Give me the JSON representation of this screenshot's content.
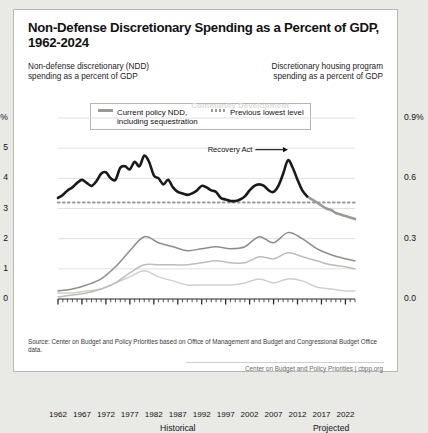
{
  "title": "Non-Defense Discretionary Spending as a Percent of GDP, 1962-2024",
  "subtitle_left": "Non-defense discretionary (NDD)\nspending as a percent of GDP",
  "subtitle_right": "Discretionary housing program\nspending as a percent of GDP",
  "legend": {
    "items": [
      {
        "label": "Current policy NDD,\nincluding sequestration",
        "style": "solid",
        "color": "#9a9a95"
      },
      {
        "label": "Previous lowest level",
        "style": "dotted",
        "color": "#9a9a95"
      }
    ]
  },
  "source": "Source: Center on Budget and Policy Priorities based on Office of Management and Budget and Congressional Budget Office data.",
  "footer": "Center on Budget and Policy Priorities | cbpp.org",
  "footer_org": "Center on Budget and Policy Priorities",
  "footer_site": "cbpp.org",
  "chart_data": {
    "type": "line",
    "title": "Non-Defense Discretionary Spending as a Percent of GDP, 1962-2024",
    "xlabel": "",
    "ylabel": "Non-defense discretionary (NDD) spending as a percent of GDP",
    "y2label": "Discretionary housing program spending as a percent of GDP",
    "xlim": [
      1962,
      2024
    ],
    "ylim": [
      0,
      6
    ],
    "y2lim": [
      0.0,
      0.9
    ],
    "grid": true,
    "legend_position": "top-center",
    "yticks": [
      0,
      1,
      2,
      3,
      4,
      5,
      6
    ],
    "yticklabels": [
      "0",
      "1",
      "2",
      "3",
      "4",
      "5",
      "6%"
    ],
    "y2ticks": [
      0.0,
      0.3,
      0.6,
      0.9
    ],
    "y2ticklabels": [
      "0.0",
      "0.3",
      "0.6",
      "0.9%"
    ],
    "xticks": [
      1962,
      1967,
      1972,
      1977,
      1982,
      1987,
      1992,
      1997,
      2002,
      2007,
      2012,
      2017,
      2022
    ],
    "xticklabels": [
      "1962",
      "1967",
      "1972",
      "1977",
      "1982",
      "1987",
      "1992",
      "1997",
      "2002",
      "2007",
      "2012",
      "2017",
      "2022"
    ],
    "period_labels": [
      {
        "text": "Historical",
        "x": 1987
      },
      {
        "text": "Projected",
        "x": 2019
      }
    ],
    "annotations": [
      {
        "text": "Recovery Act",
        "x": 2003,
        "y": 4.95,
        "arrow_to_x": 2010,
        "arrow_to_y": 5.0
      },
      {
        "text": "Combined",
        "x": 2005,
        "y": 2.45,
        "axis": "right"
      },
      {
        "text": "Housing Assistance",
        "x": 2004,
        "y": 1.72,
        "axis": "right"
      },
      {
        "text": "Community Development",
        "x": 2000,
        "y": 0.95,
        "axis": "right"
      }
    ],
    "projection_start": 2014,
    "series": [
      {
        "name": "Current policy NDD, including sequestration",
        "axis": "left",
        "color_historical": "#1a1a1a",
        "color_projected": "#9a9a95",
        "x": [
          1962,
          1963,
          1964,
          1965,
          1966,
          1967,
          1968,
          1969,
          1970,
          1971,
          1972,
          1973,
          1974,
          1975,
          1976,
          1977,
          1978,
          1979,
          1980,
          1981,
          1982,
          1983,
          1984,
          1985,
          1986,
          1987,
          1988,
          1989,
          1990,
          1991,
          1992,
          1993,
          1994,
          1995,
          1996,
          1997,
          1998,
          1999,
          2000,
          2001,
          2002,
          2003,
          2004,
          2005,
          2006,
          2007,
          2008,
          2009,
          2010,
          2011,
          2012,
          2013,
          2014,
          2015,
          2016,
          2017,
          2018,
          2019,
          2020,
          2021,
          2022,
          2023,
          2024
        ],
        "y": [
          3.35,
          3.45,
          3.6,
          3.7,
          3.85,
          3.95,
          3.85,
          3.75,
          3.9,
          4.15,
          4.2,
          4.0,
          3.95,
          4.35,
          4.4,
          4.3,
          4.55,
          4.4,
          4.75,
          4.55,
          4.1,
          4.0,
          3.8,
          3.95,
          3.7,
          3.55,
          3.5,
          3.45,
          3.5,
          3.6,
          3.75,
          3.7,
          3.6,
          3.55,
          3.35,
          3.3,
          3.25,
          3.25,
          3.3,
          3.4,
          3.6,
          3.75,
          3.8,
          3.75,
          3.6,
          3.55,
          3.75,
          4.15,
          4.6,
          4.35,
          3.95,
          3.6,
          3.4,
          3.3,
          3.2,
          3.1,
          3.0,
          2.95,
          2.85,
          2.8,
          2.75,
          2.7,
          2.65
        ]
      },
      {
        "name": "Previous lowest level",
        "axis": "left",
        "style": "dotted",
        "color": "#9a9a95",
        "value": 3.2
      },
      {
        "name": "Combined",
        "axis": "right",
        "color": "#8e8e89",
        "x": [
          1962,
          1965,
          1968,
          1971,
          1974,
          1977,
          1980,
          1983,
          1986,
          1989,
          1992,
          1995,
          1998,
          2001,
          2004,
          2007,
          2010,
          2013,
          2016,
          2019,
          2022,
          2024
        ],
        "y": [
          0.04,
          0.05,
          0.07,
          0.1,
          0.16,
          0.24,
          0.31,
          0.28,
          0.26,
          0.24,
          0.25,
          0.26,
          0.25,
          0.26,
          0.31,
          0.28,
          0.33,
          0.3,
          0.25,
          0.22,
          0.2,
          0.19
        ]
      },
      {
        "name": "Housing Assistance",
        "axis": "right",
        "color": "#bdbdb8",
        "x": [
          1962,
          1965,
          1968,
          1971,
          1974,
          1977,
          1980,
          1983,
          1986,
          1989,
          1992,
          1995,
          1998,
          2001,
          2004,
          2007,
          2010,
          2013,
          2016,
          2019,
          2022,
          2024
        ],
        "y": [
          0.01,
          0.02,
          0.03,
          0.05,
          0.08,
          0.13,
          0.17,
          0.17,
          0.17,
          0.17,
          0.18,
          0.19,
          0.18,
          0.18,
          0.21,
          0.2,
          0.23,
          0.21,
          0.19,
          0.17,
          0.16,
          0.15
        ]
      },
      {
        "name": "Community Development",
        "axis": "right",
        "color": "#cfcfca",
        "x": [
          1962,
          1965,
          1968,
          1971,
          1974,
          1977,
          1980,
          1983,
          1986,
          1989,
          1992,
          1995,
          1998,
          2001,
          2004,
          2007,
          2010,
          2013,
          2016,
          2019,
          2022,
          2024
        ],
        "y": [
          0.03,
          0.03,
          0.04,
          0.05,
          0.08,
          0.11,
          0.14,
          0.11,
          0.09,
          0.07,
          0.07,
          0.07,
          0.07,
          0.08,
          0.1,
          0.08,
          0.1,
          0.09,
          0.06,
          0.05,
          0.04,
          0.04
        ]
      }
    ]
  }
}
